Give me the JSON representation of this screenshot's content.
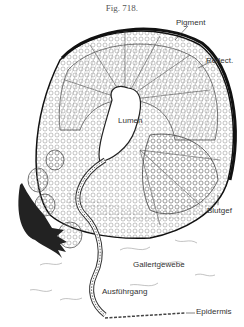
{
  "figure": {
    "title": "Fig. 718.",
    "labels": {
      "pigment": "Pigment",
      "reflect": "Reflect.",
      "lumen": "Lumen",
      "blutgef": "Blutgef",
      "gallertgewebe": "Gallertgewebe",
      "ausfuhrgang": "Ausführgang",
      "epidermis": "Epidermis"
    }
  }
}
